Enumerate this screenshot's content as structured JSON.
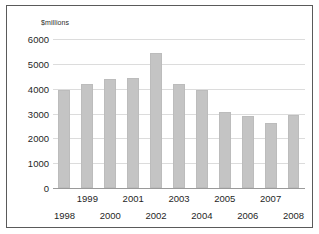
{
  "chart_data": {
    "type": "bar",
    "title": "",
    "subtitle": "",
    "xlabel": "",
    "ylabel": "$millions",
    "ylim": [
      0,
      6000
    ],
    "ytick_step": 1000,
    "yticks": [
      0,
      1000,
      2000,
      3000,
      4000,
      5000,
      6000
    ],
    "ytick_labels": [
      "0",
      "1000",
      "2000",
      "3000",
      "4000",
      "5000",
      "6000"
    ],
    "grid": true,
    "legend": null,
    "legend_position": "none",
    "categories": [
      "1998",
      "1999",
      "2000",
      "2001",
      "2002",
      "2003",
      "2004",
      "2005",
      "2006",
      "2007",
      "2008"
    ],
    "values": [
      3930,
      4200,
      4400,
      4420,
      5420,
      4200,
      3940,
      3070,
      2880,
      2620,
      2950
    ],
    "bar_color": "#c4c4c4",
    "bar_border_color": "#bcbcbc",
    "gridline_color": "#dcdcdc",
    "axis_color": "#9a9a9a",
    "frame_color": "#5a5a5a",
    "background_color": "#ffffff",
    "xtick_label_rows": [
      1,
      0,
      1,
      0,
      1,
      0,
      1,
      0,
      1,
      0,
      1
    ]
  }
}
